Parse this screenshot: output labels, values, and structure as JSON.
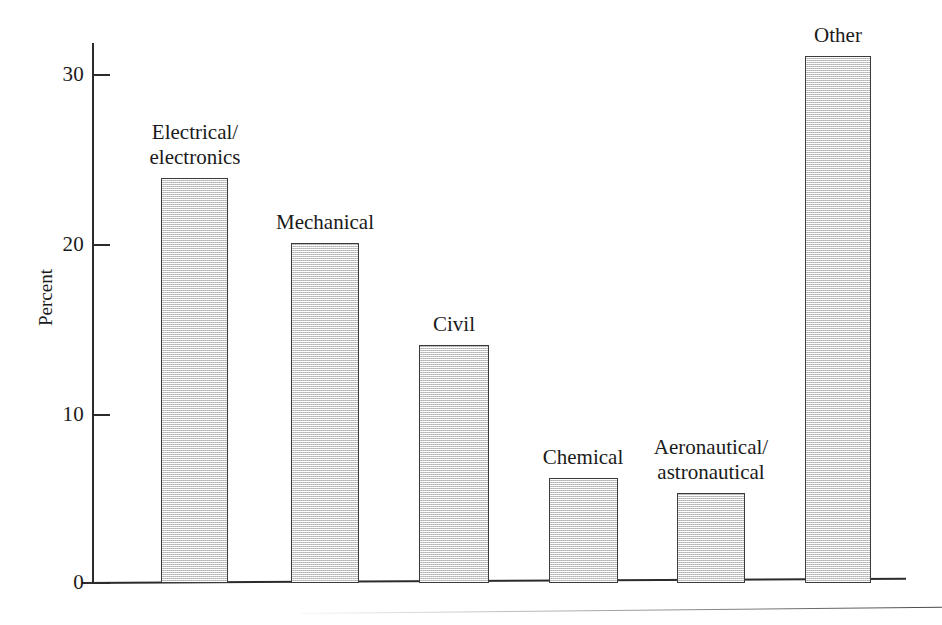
{
  "chart_data": {
    "type": "bar",
    "title": "",
    "xlabel": "",
    "ylabel": "Percent",
    "ylim": [
      0,
      33
    ],
    "grid": false,
    "legend": "none",
    "y_ticks": [
      "0",
      "10",
      "20",
      "30"
    ],
    "y_tick_values": [
      0,
      10,
      20,
      30
    ],
    "categories": [
      "Electrical/\nelectronics",
      "Mechanical",
      "Civil",
      "Chemical",
      "Aeronautical/\nastronautical",
      "Other"
    ],
    "values": [
      23.8,
      20.0,
      14.0,
      6.2,
      5.3,
      31.0
    ],
    "bars": [
      {
        "label_line1": "Electrical/",
        "label_line2": "electronics",
        "value": 23.8
      },
      {
        "label_line1": "Mechanical",
        "label_line2": "",
        "value": 20.0
      },
      {
        "label_line1": "Civil",
        "label_line2": "",
        "value": 14.0
      },
      {
        "label_line1": "Chemical",
        "label_line2": "",
        "value": 6.2
      },
      {
        "label_line1": "Aeronautical/",
        "label_line2": "astronautical",
        "value": 5.3
      },
      {
        "label_line1": "Other",
        "label_line2": "",
        "value": 31.0
      }
    ],
    "colors": {
      "bar_fill": "#dddddd",
      "bar_stroke": "#3a3a3a",
      "axis": "#2b2b2b",
      "text": "#1a1a1a",
      "background": "#ffffff"
    }
  }
}
